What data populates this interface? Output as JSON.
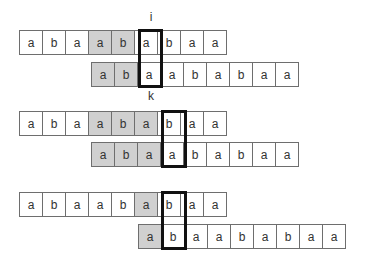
{
  "diagram": {
    "labels": {
      "i": "i",
      "k": "k"
    },
    "steps": [
      {
        "text_row": {
          "cells": [
            "a",
            "b",
            "a",
            "a",
            "b",
            "a",
            "b",
            "a",
            "a"
          ],
          "shaded": [
            3,
            4
          ]
        },
        "pattern_row": {
          "cells": [
            "a",
            "b",
            "a",
            "a",
            "b",
            "a",
            "b",
            "a",
            "a"
          ],
          "shaded": [
            0,
            1
          ]
        },
        "highlight_text_index": 5,
        "highlight_pattern_index": 2
      },
      {
        "text_row": {
          "cells": [
            "a",
            "b",
            "a",
            "a",
            "b",
            "a",
            "b",
            "a",
            "a"
          ],
          "shaded": [
            3,
            4,
            5
          ]
        },
        "pattern_row": {
          "cells": [
            "a",
            "b",
            "a",
            "a",
            "b",
            "a",
            "b",
            "a",
            "a"
          ],
          "shaded": [
            0,
            1,
            2
          ]
        },
        "highlight_text_index": 6,
        "highlight_pattern_index": 3
      },
      {
        "text_row": {
          "cells": [
            "a",
            "b",
            "a",
            "a",
            "b",
            "a",
            "b",
            "a",
            "a"
          ],
          "shaded": [
            5
          ]
        },
        "pattern_row": {
          "cells": [
            "a",
            "b",
            "a",
            "a",
            "b",
            "a",
            "b",
            "a",
            "a"
          ],
          "shaded": [
            0
          ]
        },
        "highlight_text_index": 6,
        "highlight_pattern_index": 1
      }
    ],
    "colors": {
      "shade": "#d0d0d0",
      "border": "#6e6e6e",
      "highlight": "#111111"
    }
  }
}
